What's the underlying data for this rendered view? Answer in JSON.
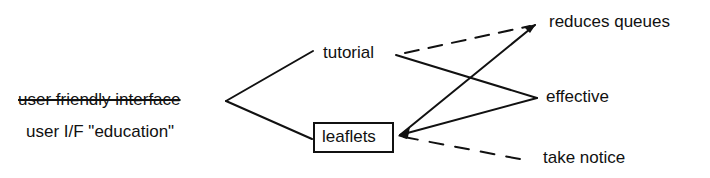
{
  "diagram": {
    "root": {
      "struck_label": "user friendly interface",
      "label": "user I/F \"education\""
    },
    "middle_nodes": {
      "tutorial": "tutorial",
      "leaflets": "leaflets"
    },
    "outcome_nodes": {
      "reduces_queues": "reduces queues",
      "effective": "effective",
      "take_notice": "take notice"
    },
    "edges": [
      {
        "from": "root",
        "to": "tutorial",
        "style": "solid"
      },
      {
        "from": "root",
        "to": "leaflets",
        "style": "solid"
      },
      {
        "from": "tutorial",
        "to": "reduces queues",
        "style": "dashed"
      },
      {
        "from": "tutorial",
        "to": "effective",
        "style": "solid"
      },
      {
        "from": "reduces queues",
        "to": "leaflets",
        "style": "solid-arrow"
      },
      {
        "from": "effective",
        "to": "leaflets",
        "style": "solid-arrow"
      },
      {
        "from": "leaflets",
        "to": "take notice",
        "style": "dashed"
      }
    ],
    "colors": {
      "ink": "#111111",
      "background": "#ffffff"
    }
  }
}
